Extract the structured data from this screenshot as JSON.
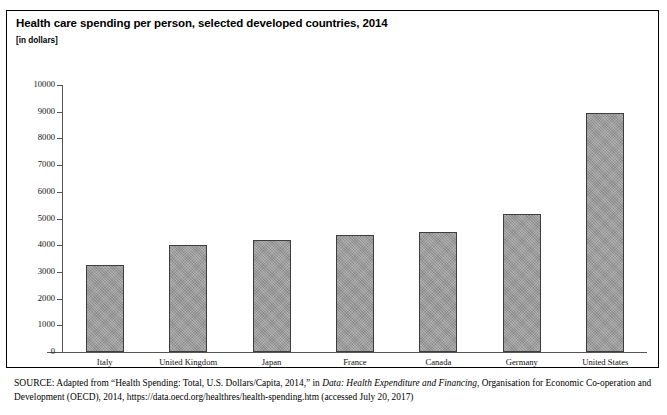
{
  "figure": {
    "title": "Health care spending per person, selected developed countries, 2014",
    "subtitle": "[in dollars]"
  },
  "source": {
    "label": "SOURCE:",
    "text_before_italic": " Adapted from “Health Spending: Total, U.S. Dollars/Capita, 2014,” in ",
    "italic_title": "Data: Health Expenditure and Financing",
    "text_after_italic": ", Organisation for Economic Co-operation and Development (OECD), 2014, https://data.oecd.org/healthres/health-spending.htm (accessed July 20, 2017)"
  },
  "colors": {
    "bar_fill": "#9d9d9d",
    "bar_border": "#3d3d3d",
    "axis": "#555555",
    "frame": "#000000"
  },
  "chart_data": {
    "type": "bar",
    "title": "Health care spending per person, selected developed countries, 2014",
    "subtitle": "[in dollars]",
    "xlabel": "",
    "ylabel": "",
    "ylim": [
      0,
      10000
    ],
    "ytick_step": 1000,
    "yticks": [
      0,
      1000,
      2000,
      3000,
      4000,
      5000,
      6000,
      7000,
      8000,
      9000,
      10000
    ],
    "ytick_labels": [
      "0",
      "1000",
      "2000",
      "3000",
      "4000",
      "5000",
      "6000",
      "7000",
      "8000",
      "9000",
      "10000"
    ],
    "grid": false,
    "legend": false,
    "categories": [
      "Italy",
      "United Kingdom",
      "Japan",
      "France",
      "Canada",
      "Germany",
      "United States"
    ],
    "values": [
      3250,
      4000,
      4200,
      4400,
      4500,
      5150,
      8950
    ]
  }
}
